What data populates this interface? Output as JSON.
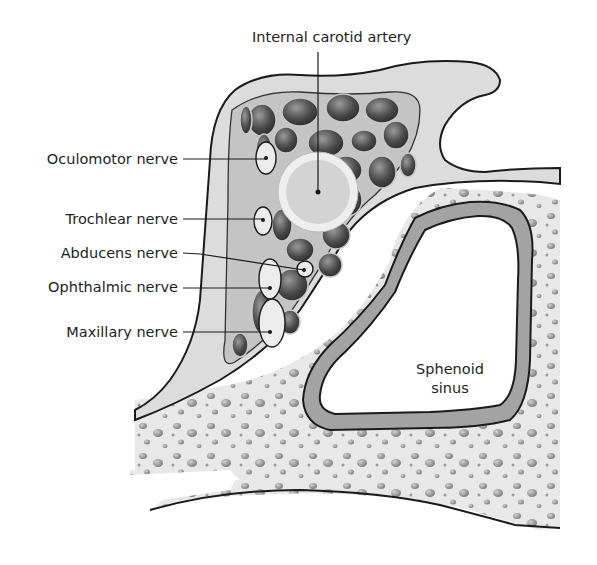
{
  "diagram": {
    "colors": {
      "bone": "#e6e6e6",
      "dura": "#d8d8d8",
      "sinus_bg": "#bdbdbd",
      "venous_channels": "#5a5a5a",
      "outline": "#1a1a1a",
      "mucosa": "#9d9d9d"
    },
    "labels": {
      "internal_carotid_artery": "Internal carotid artery",
      "oculomotor_nerve": "Oculomotor nerve",
      "trochlear_nerve": "Trochlear nerve",
      "abducens_nerve": "Abducens nerve",
      "ophthalmic_nerve": "Ophthalmic nerve",
      "maxillary_nerve": "Maxillary nerve",
      "sphenoid_sinus_line1": "Sphenoid",
      "sphenoid_sinus_line2": "sinus"
    }
  }
}
